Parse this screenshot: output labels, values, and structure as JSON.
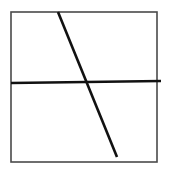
{
  "diagram": {
    "width": 170,
    "height": 173,
    "background": "#ffffff",
    "frame": {
      "x1": 11,
      "y1": 12,
      "x2": 157,
      "y2": 162,
      "stroke": "#4a4a4a",
      "stroke_width": 1.6
    },
    "horizontal_line": {
      "x1": 11,
      "y1": 83,
      "x2": 161,
      "y2": 81,
      "stroke": "#111111",
      "stroke_width": 2.6
    },
    "diagonal_line": {
      "x1": 58,
      "y1": 12,
      "x2": 117,
      "y2": 157,
      "stroke": "#111111",
      "stroke_width": 2.6
    }
  }
}
